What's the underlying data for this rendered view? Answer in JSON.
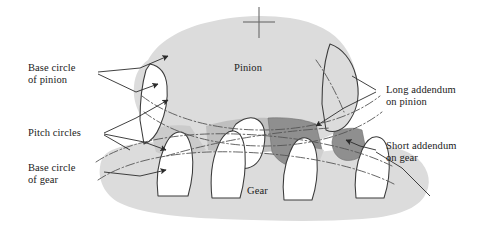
{
  "figure": {
    "type": "engineering-diagram",
    "background_color": "#ffffff"
  },
  "colors": {
    "body_fill": "#dcdcdc",
    "body_fill_light": "#e2e2e2",
    "addendum_shade_dark": "#8f8f8f",
    "addendum_shade_mid": "#a8a8a8",
    "addendum_shade_light": "#c6c6c6",
    "outline": "#3a3a3a",
    "centerline": "#555555",
    "leader": "#2b2b2b",
    "text": "#1a1a1a"
  },
  "body_labels": {
    "pinion": "Pinion",
    "gear": "Gear"
  },
  "callouts": [
    {
      "id": "base-circle-of-pinion",
      "line1": "Base circle",
      "line2": "of pinion",
      "side": "left"
    },
    {
      "id": "pitch-circles",
      "line1": "Pitch circles",
      "line2": "",
      "side": "left"
    },
    {
      "id": "base-circle-of-gear",
      "line1": "Base circle",
      "line2": "of gear",
      "side": "left"
    },
    {
      "id": "long-addendum-on-pinion",
      "line1": "Long addendum",
      "line2": "on pinion",
      "side": "right"
    },
    {
      "id": "short-addendum-on-gear",
      "line1": "Short addendum",
      "line2": "on gear",
      "side": "right"
    }
  ],
  "markers": {
    "center_crosshair": "pinion-center-mark"
  }
}
